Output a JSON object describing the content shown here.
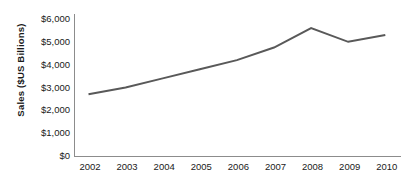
{
  "chart_data": {
    "type": "line",
    "title": "",
    "xlabel": "",
    "ylabel": "Sales ($US Billions)",
    "categories": [
      "2002",
      "2003",
      "2004",
      "2005",
      "2006",
      "2007",
      "2008",
      "2009",
      "2010"
    ],
    "values": [
      2700,
      3000,
      3400,
      3800,
      4200,
      4750,
      5600,
      5000,
      5300
    ],
    "series": [
      {
        "name": "Sales",
        "values": [
          2700,
          3000,
          3400,
          3800,
          4200,
          4750,
          5600,
          5000,
          5300
        ],
        "color": "#595959"
      }
    ],
    "ylim": [
      0,
      6000
    ],
    "ytick_values": [
      0,
      1000,
      2000,
      3000,
      4000,
      5000,
      6000
    ],
    "ytick_labels": [
      "$0",
      "$1,000",
      "$2,000",
      "$3,000",
      "$4,000",
      "$5,000",
      "$6,000"
    ],
    "xtick_labels": [
      "2002",
      "2003",
      "2004",
      "2005",
      "2006",
      "2007",
      "2008",
      "2009",
      "2010"
    ],
    "grid": false,
    "legend": false,
    "legend_position": "none",
    "line_color": "#595959",
    "line_width": 2,
    "markers": false,
    "axis_color": "#8c8c8c",
    "background_color": "#ffffff",
    "text_color": "#1a1a1a"
  }
}
